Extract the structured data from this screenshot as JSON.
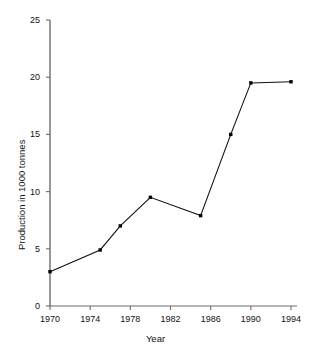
{
  "chart_data": {
    "type": "line",
    "title": "",
    "xlabel": "Year",
    "ylabel": "Production in 1000 tonnes",
    "x": [
      1970,
      1975,
      1977,
      1980,
      1985,
      1988,
      1990,
      1994
    ],
    "values": [
      3.0,
      4.9,
      7.0,
      9.5,
      7.9,
      15.0,
      19.5,
      19.6
    ],
    "series": [
      {
        "name": "Production",
        "points": [
          {
            "x": 1970,
            "y": 3.0
          },
          {
            "x": 1975,
            "y": 4.9
          },
          {
            "x": 1977,
            "y": 7.0
          },
          {
            "x": 1980,
            "y": 9.5
          },
          {
            "x": 1985,
            "y": 7.9
          },
          {
            "x": 1988,
            "y": 15.0
          },
          {
            "x": 1990,
            "y": 19.5
          },
          {
            "x": 1994,
            "y": 19.6
          }
        ]
      }
    ],
    "xlim": [
      1970,
      1994
    ],
    "ylim": [
      0,
      25
    ],
    "xticks": [
      1970,
      1974,
      1978,
      1982,
      1986,
      1990,
      1994
    ],
    "yticks": [
      0,
      5,
      10,
      15,
      20,
      25
    ],
    "xtick_labels": [
      "1970",
      "1974",
      "1978",
      "1982",
      "1986",
      "1990",
      "1994"
    ],
    "ytick_labels": [
      "0",
      "5",
      "10",
      "15",
      "20",
      "25"
    ],
    "grid": false,
    "legend": false,
    "legend_position": "none",
    "line_color": "#111111",
    "marker_color": "#000000",
    "marker": "square",
    "axis_color": "#6b6b6b",
    "background_color": "#ffffff"
  }
}
